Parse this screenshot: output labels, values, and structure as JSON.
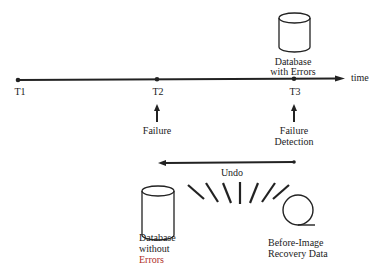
{
  "timeline": {
    "axis_label": "time",
    "points": [
      {
        "label": "T1"
      },
      {
        "label": "T2"
      },
      {
        "label": "T3"
      }
    ]
  },
  "database_with_errors": {
    "line1": "Database",
    "line2": "with Errors"
  },
  "events": {
    "failure": "Failure",
    "failure_detection_line1": "Failure",
    "failure_detection_line2": "Detection"
  },
  "undo": {
    "label": "Undo"
  },
  "database_without_errors": {
    "line1": "Database",
    "line2": "without",
    "line3": "Errors"
  },
  "recovery_data": {
    "line1": "Before-Image",
    "line2": "Recovery Data"
  },
  "colors": {
    "ink": "#222222",
    "accent_red": "#b0302a"
  }
}
